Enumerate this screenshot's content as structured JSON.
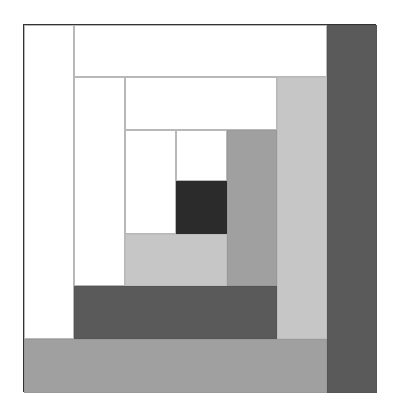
{
  "colors": {
    "white": "#ffffff",
    "light_gray": "#c6c6c6",
    "mid_gray": "#a0a0a0",
    "dark_gray": "#5a5a5a",
    "center": "#2b2b2b",
    "outline": "#333333"
  },
  "patches": [
    {
      "name": "center",
      "x": 152,
      "y": 156,
      "w": 51,
      "h": 53,
      "tone": "center"
    },
    {
      "name": "ring1-top",
      "x": 152,
      "y": 105,
      "w": 51,
      "h": 51,
      "tone": "white"
    },
    {
      "name": "ring1-left",
      "x": 101,
      "y": 105,
      "w": 51,
      "h": 104,
      "tone": "white"
    },
    {
      "name": "ring1-bottom",
      "x": 101,
      "y": 209,
      "w": 102,
      "h": 52,
      "tone": "light"
    },
    {
      "name": "ring1-right",
      "x": 203,
      "y": 105,
      "w": 50,
      "h": 156,
      "tone": "mid"
    },
    {
      "name": "ring2-top",
      "x": 101,
      "y": 52,
      "w": 152,
      "h": 53,
      "tone": "white"
    },
    {
      "name": "ring2-left",
      "x": 50,
      "y": 52,
      "w": 51,
      "h": 209,
      "tone": "white"
    },
    {
      "name": "ring2-bottom",
      "x": 50,
      "y": 261,
      "w": 203,
      "h": 53,
      "tone": "dark"
    },
    {
      "name": "ring2-right",
      "x": 253,
      "y": 52,
      "w": 50,
      "h": 262,
      "tone": "light"
    },
    {
      "name": "ring3-top",
      "x": 50,
      "y": 0,
      "w": 253,
      "h": 52,
      "tone": "white"
    },
    {
      "name": "ring3-left",
      "x": 0,
      "y": 0,
      "w": 50,
      "h": 314,
      "tone": "white"
    },
    {
      "name": "ring3-bottom",
      "x": 0,
      "y": 314,
      "w": 303,
      "h": 54,
      "tone": "mid"
    },
    {
      "name": "ring3-right",
      "x": 303,
      "y": 0,
      "w": 50,
      "h": 368,
      "tone": "dark"
    }
  ]
}
